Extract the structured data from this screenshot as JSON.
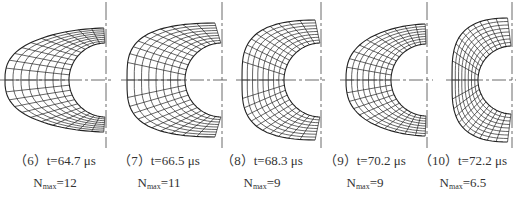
{
  "figure": {
    "panels": [
      {
        "id": 6,
        "label": "（6）t=64.7 μs",
        "n_symbol": "N",
        "n_sub": "max",
        "n_value": "=12",
        "axis_x": 106,
        "outer_left": 5,
        "inner_r": 37,
        "outer_top": 28,
        "shape": "pointed",
        "caption_x": 0
      },
      {
        "id": 7,
        "label": "（7）t=66.5 μs",
        "n_symbol": "N",
        "n_sub": "max",
        "n_value": "=11",
        "axis_x": 222,
        "outer_left": 127,
        "inner_r": 37,
        "outer_top": 23,
        "shape": "round",
        "caption_x": 104
      },
      {
        "id": 8,
        "label": "（8）t=68.3 μs",
        "n_symbol": "N",
        "n_sub": "max",
        "n_value": "=9",
        "axis_x": 321,
        "outer_left": 242,
        "inner_r": 37,
        "outer_top": 20,
        "shape": "round",
        "caption_x": 207
      },
      {
        "id": 9,
        "label": "（9）t=70.2 μs",
        "n_symbol": "N",
        "n_sub": "max",
        "n_value": "=9",
        "axis_x": 427,
        "outer_left": 346,
        "inner_r": 36,
        "outer_top": 24,
        "shape": "pointed",
        "caption_x": 310
      },
      {
        "id": 10,
        "label": "（10）t=72.2 μs",
        "n_symbol": "N",
        "n_sub": "max",
        "n_value": "=6.5",
        "axis_x": 512,
        "outer_left": 452,
        "inner_r": 34,
        "outer_top": 18,
        "shape": "round",
        "caption_x": 408
      }
    ],
    "axis_y": 80,
    "line_color": "#222222",
    "axis_color": "#444444"
  }
}
